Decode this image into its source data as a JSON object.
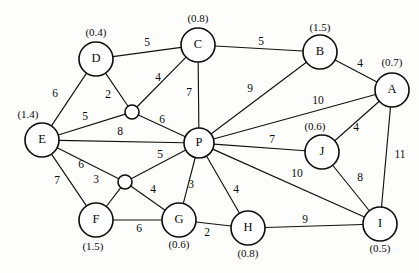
{
  "diagram": {
    "background_color": "#fdfdfb",
    "stroke_color": "#111111",
    "node_fill": "#ffffff"
  },
  "chart_data": {
    "type": "diagram",
    "graph_type": "weighted-undirected-graph",
    "title": "",
    "nodes": [
      {
        "id": "D",
        "label": "D",
        "weight": "(0.4)",
        "x": 96,
        "y": 59,
        "r": 17,
        "weight_x": 96,
        "weight_y": 33
      },
      {
        "id": "C",
        "label": "C",
        "weight": "(0.8)",
        "x": 198,
        "y": 45,
        "r": 17,
        "weight_x": 198,
        "weight_y": 19
      },
      {
        "id": "B",
        "label": "B",
        "weight": "(1.5)",
        "x": 320,
        "y": 52,
        "r": 17,
        "weight_x": 320,
        "weight_y": 28
      },
      {
        "id": "A",
        "label": "A",
        "weight": "(0.7)",
        "x": 392,
        "y": 90,
        "r": 17,
        "weight_x": 392,
        "weight_y": 63
      },
      {
        "id": "E",
        "label": "E",
        "weight": "(1.4)",
        "x": 42,
        "y": 140,
        "r": 17,
        "weight_x": 28,
        "weight_y": 115
      },
      {
        "id": "P",
        "label": "P",
        "weight": "",
        "x": 199,
        "y": 143,
        "r": 15,
        "weight_x": 0,
        "weight_y": 0
      },
      {
        "id": "J",
        "label": "J",
        "weight": "(0.6)",
        "x": 322,
        "y": 152,
        "r": 17,
        "weight_x": 315,
        "weight_y": 127
      },
      {
        "id": "I",
        "label": "I",
        "weight": "(0.5)",
        "x": 380,
        "y": 224,
        "r": 17,
        "weight_x": 380,
        "weight_y": 249
      },
      {
        "id": "F",
        "label": "F",
        "weight": "(1.5)",
        "x": 96,
        "y": 220,
        "r": 17,
        "weight_x": 93,
        "weight_y": 247
      },
      {
        "id": "G",
        "label": "G",
        "weight": "(0.6)",
        "x": 179,
        "y": 220,
        "r": 17,
        "weight_x": 179,
        "weight_y": 245
      },
      {
        "id": "H",
        "label": "H",
        "weight": "(0.8)",
        "x": 248,
        "y": 228,
        "r": 17,
        "weight_x": 248,
        "weight_y": 254
      }
    ],
    "junctions": [
      {
        "id": "J1",
        "x": 132,
        "y": 112,
        "r": 7
      },
      {
        "id": "J2",
        "x": 125,
        "y": 182,
        "r": 7
      }
    ],
    "edges": [
      {
        "from": "D",
        "to": "C",
        "weight": "5",
        "label_x": 147,
        "label_y": 43
      },
      {
        "from": "C",
        "to": "B",
        "weight": "5",
        "label_x": 261,
        "label_y": 42
      },
      {
        "from": "B",
        "to": "A",
        "weight": "4",
        "label_x": 360,
        "label_y": 64
      },
      {
        "from": "D",
        "to": "E",
        "weight": "6",
        "label_x": 55,
        "label_y": 94
      },
      {
        "from": "D",
        "to": "J1",
        "weight": "2",
        "label_x": 108,
        "label_y": 95
      },
      {
        "from": "C",
        "to": "J1",
        "weight": "4",
        "label_x": 158,
        "label_y": 78
      },
      {
        "from": "C",
        "to": "P",
        "weight": "7",
        "label_x": 189,
        "label_y": 93
      },
      {
        "from": "E",
        "to": "J1",
        "weight": "5",
        "label_x": 85,
        "label_y": 117
      },
      {
        "from": "J1",
        "to": "P",
        "weight": "6",
        "label_x": 162,
        "label_y": 120
      },
      {
        "from": "E",
        "to": "P",
        "weight": "8",
        "label_x": 120,
        "label_y": 132
      },
      {
        "from": "B",
        "to": "P",
        "weight": "9",
        "label_x": 250,
        "label_y": 89
      },
      {
        "from": "A",
        "to": "P",
        "weight": "10",
        "label_x": 318,
        "label_y": 101
      },
      {
        "from": "A",
        "to": "J",
        "weight": "4",
        "label_x": 356,
        "label_y": 128
      },
      {
        "from": "A",
        "to": "I",
        "weight": "11",
        "label_x": 400,
        "label_y": 155
      },
      {
        "from": "P",
        "to": "J",
        "weight": "7",
        "label_x": 272,
        "label_y": 140
      },
      {
        "from": "J",
        "to": "I",
        "weight": "8",
        "label_x": 360,
        "label_y": 178
      },
      {
        "from": "P",
        "to": "I",
        "weight": "10",
        "label_x": 297,
        "label_y": 174
      },
      {
        "from": "E",
        "to": "J2",
        "weight": "6",
        "label_x": 81,
        "label_y": 165
      },
      {
        "from": "E",
        "to": "F",
        "weight": "7",
        "label_x": 57,
        "label_y": 181
      },
      {
        "from": "J2",
        "to": "F",
        "weight": "3",
        "label_x": 96,
        "label_y": 180
      },
      {
        "from": "J2",
        "to": "P",
        "weight": "5",
        "label_x": 160,
        "label_y": 155
      },
      {
        "from": "J2",
        "to": "G",
        "weight": "4",
        "label_x": 153,
        "label_y": 190
      },
      {
        "from": "F",
        "to": "G",
        "weight": "6",
        "label_x": 139,
        "label_y": 229
      },
      {
        "from": "P",
        "to": "G",
        "weight": "3",
        "label_x": 191,
        "label_y": 185
      },
      {
        "from": "P",
        "to": "H",
        "weight": "4",
        "label_x": 236,
        "label_y": 190
      },
      {
        "from": "G",
        "to": "H",
        "weight": "2",
        "label_x": 207,
        "label_y": 233
      },
      {
        "from": "H",
        "to": "I",
        "weight": "9",
        "label_x": 305,
        "label_y": 220
      }
    ]
  }
}
